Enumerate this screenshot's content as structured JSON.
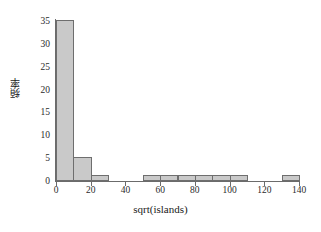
{
  "chart_data": {
    "type": "bar",
    "title": "",
    "subtitle": "",
    "xlabel": "sqrt(islands)",
    "ylabel": "頻率",
    "xlim": [
      0,
      140
    ],
    "ylim": [
      0,
      35
    ],
    "grid": false,
    "legend": null,
    "bin_width": 10,
    "xticks": [
      0,
      20,
      40,
      60,
      80,
      100,
      120,
      140
    ],
    "yticks": [
      0,
      5,
      10,
      15,
      20,
      25,
      30,
      35
    ],
    "bins": [
      {
        "x0": 0,
        "x1": 10,
        "value": 35
      },
      {
        "x0": 10,
        "x1": 20,
        "value": 5
      },
      {
        "x0": 20,
        "x1": 30,
        "value": 1
      },
      {
        "x0": 30,
        "x1": 40,
        "value": 0
      },
      {
        "x0": 40,
        "x1": 50,
        "value": 0
      },
      {
        "x0": 50,
        "x1": 60,
        "value": 1
      },
      {
        "x0": 60,
        "x1": 70,
        "value": 1
      },
      {
        "x0": 70,
        "x1": 80,
        "value": 1
      },
      {
        "x0": 80,
        "x1": 90,
        "value": 1
      },
      {
        "x0": 90,
        "x1": 100,
        "value": 1
      },
      {
        "x0": 100,
        "x1": 110,
        "value": 1
      },
      {
        "x0": 110,
        "x1": 120,
        "value": 0
      },
      {
        "x0": 120,
        "x1": 130,
        "value": 0
      },
      {
        "x0": 130,
        "x1": 140,
        "value": 1
      }
    ],
    "colors": {
      "bar_fill": "#c9c9c9",
      "bar_border": "#6e6e6e",
      "axis": "#6b6b6b",
      "text": "#1a1a1a",
      "background": "#ffffff"
    }
  }
}
